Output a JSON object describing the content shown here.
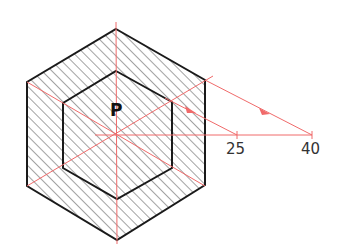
{
  "diagram": {
    "title": "",
    "point_label": "P",
    "scale_labels": [
      "25",
      "40"
    ],
    "colors": {
      "outline": "#1a1a1a",
      "hatch": "#555555",
      "construction": "#f06a6a"
    },
    "shapes": {
      "outer_hexagon": [
        [
          116,
          29
        ],
        [
          205,
          80
        ],
        [
          205,
          185
        ],
        [
          117,
          240
        ],
        [
          27,
          186
        ],
        [
          27,
          82
        ]
      ],
      "inner_hexagon": [
        [
          116,
          71
        ],
        [
          172,
          102
        ],
        [
          172,
          168
        ],
        [
          117,
          199
        ],
        [
          63,
          168
        ],
        [
          63,
          103
        ]
      ],
      "center": [
        117,
        135
      ]
    }
  }
}
